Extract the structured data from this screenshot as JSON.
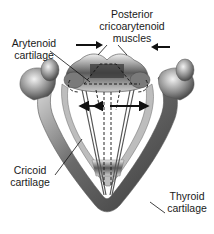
{
  "diagram": {
    "labels": {
      "posterior_muscles": [
        "Posterior",
        "cricoarytenoid",
        "muscles"
      ],
      "arytenoid": [
        "Arytenoid",
        "cartilage"
      ],
      "cricoid": [
        "Cricoid",
        "cartilage"
      ],
      "thyroid": [
        "Thyroid",
        "cartilage"
      ]
    },
    "arrows": {
      "inward": [
        "left-arrow-pointing-right",
        "right-arrow-pointing-left"
      ],
      "outward": [
        "double-arrow-abduction"
      ]
    },
    "colors": {
      "cartilage_dark": "#4a4a4a",
      "cartilage_mid": "#8a8a8a",
      "cartilage_light": "#d8d8d8",
      "text": "#1a1a1a"
    }
  }
}
